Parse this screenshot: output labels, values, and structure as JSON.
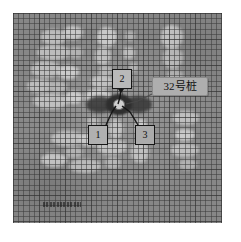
{
  "figure": {
    "kind": "grayscale-gridded-tomography-plate",
    "background_color": "#8e8e8e",
    "anomaly_color": "#c9c9c9",
    "grid_line_color": "#3a3a3a",
    "grid_cell_px": 5,
    "plate_bounds": {
      "left": 13,
      "top": 13,
      "width": 209,
      "height": 210
    }
  },
  "pile_label": {
    "text": "32号桩",
    "box_color": "#aeaeae",
    "border_color": "#8a8a8a"
  },
  "callouts": [
    {
      "id": "callout-1",
      "label": "1",
      "position": "bottom-left"
    },
    {
      "id": "callout-2",
      "label": "2",
      "position": "top-center"
    },
    {
      "id": "callout-3",
      "label": "3",
      "position": "bottom-right"
    }
  ],
  "center_marker": {
    "name": "pile-cross-section",
    "dark_anomaly_color": "#2e2e2e",
    "core_color": "#cfcfcf"
  },
  "caption": {
    "text": "",
    "note": "illegible"
  }
}
